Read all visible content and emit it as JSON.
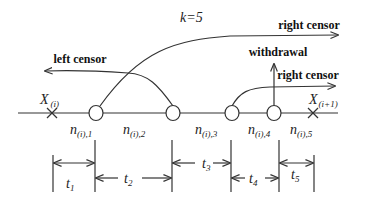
{
  "title": "k=5",
  "labels": {
    "right_censor_top": "right censor",
    "right_censor_bottom": "right censor",
    "left_censor": "left censor",
    "withdrawal": "withdrawal"
  },
  "crosses": [
    {
      "main": "X",
      "sub": "(i)"
    },
    {
      "main": "X",
      "sub": "(i+1)"
    }
  ],
  "nodes": [
    {
      "main": "n",
      "sub": "(i),1"
    },
    {
      "main": "n",
      "sub": "(i),2"
    },
    {
      "main": "n",
      "sub": "(i),3"
    },
    {
      "main": "n",
      "sub": "(i),4"
    },
    {
      "main": "n",
      "sub": "(i),5"
    }
  ],
  "intervals": [
    {
      "main": "t",
      "sub": "1"
    },
    {
      "main": "t",
      "sub": "2"
    },
    {
      "main": "t",
      "sub": "3"
    },
    {
      "main": "t",
      "sub": "4"
    },
    {
      "main": "t",
      "sub": "5"
    }
  ]
}
